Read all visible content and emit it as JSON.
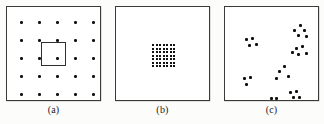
{
  "figure": {
    "panel_count": 3,
    "background_color": "#fcfcfb",
    "ink_color": "#101010",
    "border_color": "#3a3a3a"
  },
  "panels": [
    {
      "id": "a",
      "caption": "(a)",
      "description": "regular lattice of dots with highlight box around centre dot",
      "frame": {
        "x": 6,
        "y": 6,
        "width": 95,
        "height": 95
      },
      "pattern": "regular-grid",
      "grid": {
        "rows": 5,
        "cols": 5,
        "start_x": 13,
        "start_y": 14,
        "step_x": 18,
        "step_y": 18
      },
      "highlight_box": {
        "x": 34,
        "y": 35,
        "width": 25,
        "height": 24
      }
    },
    {
      "id": "b",
      "caption": "(b)",
      "description": "single dense cluster of dots at the centre of an otherwise empty frame",
      "frame": {
        "x": 115,
        "y": 6,
        "width": 95,
        "height": 95
      },
      "pattern": "dense-cluster",
      "cluster": {
        "rows": 7,
        "cols": 7,
        "start_x": 36,
        "start_y": 37,
        "step_x": 3.5,
        "step_y": 3.5
      }
    },
    {
      "id": "c",
      "caption": "(c)",
      "description": "randomly scattered dots forming several small clusters",
      "frame": {
        "x": 224,
        "y": 6,
        "width": 95,
        "height": 95
      },
      "pattern": "random-clusters",
      "points": [
        [
          20,
          31
        ],
        [
          26,
          30
        ],
        [
          23,
          37
        ],
        [
          30,
          36
        ],
        [
          18,
          70
        ],
        [
          24,
          69
        ],
        [
          20,
          76
        ],
        [
          45,
          90
        ],
        [
          50,
          90
        ],
        [
          53,
          63
        ],
        [
          58,
          58
        ],
        [
          50,
          70
        ],
        [
          62,
          68
        ],
        [
          68,
          22
        ],
        [
          74,
          17
        ],
        [
          78,
          22
        ],
        [
          72,
          27
        ],
        [
          80,
          28
        ],
        [
          70,
          40
        ],
        [
          76,
          38
        ],
        [
          72,
          46
        ],
        [
          80,
          45
        ],
        [
          66,
          44
        ],
        [
          64,
          84
        ],
        [
          70,
          83
        ],
        [
          67,
          89
        ],
        [
          73,
          89
        ]
      ]
    }
  ]
}
